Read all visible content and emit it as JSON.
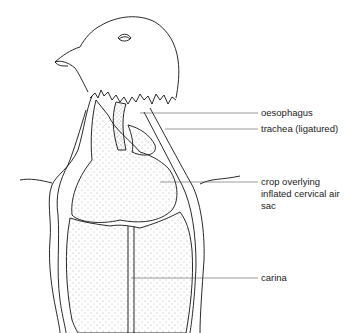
{
  "figure": {
    "labels": [
      {
        "id": "oesophagus",
        "text": "oesophagus"
      },
      {
        "id": "trachea",
        "text": "trachea (ligatured)"
      },
      {
        "id": "crop",
        "line1": "crop overlying",
        "line2": "inflated cervical air",
        "line3": "sac"
      },
      {
        "id": "carina",
        "text": "carina"
      }
    ]
  }
}
